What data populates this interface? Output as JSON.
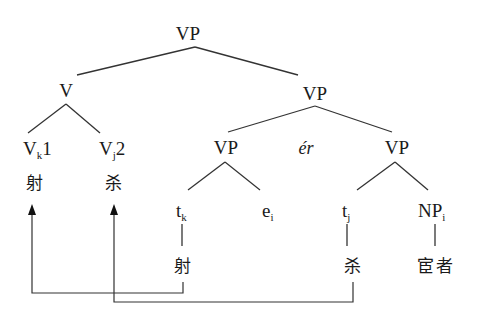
{
  "diagram": {
    "type": "syntax-tree",
    "nodes": {
      "root": {
        "label": "VP"
      },
      "v": {
        "label": "V"
      },
      "vk1": {
        "label": "V",
        "sub": "k",
        "suffix": "1",
        "gloss": "射"
      },
      "vj2": {
        "label": "V",
        "sub": "j",
        "suffix": "2",
        "gloss": "杀"
      },
      "vp_mid": {
        "label": "VP"
      },
      "vp_left": {
        "label": "VP"
      },
      "conj": {
        "label": "ér"
      },
      "vp_right": {
        "label": "VP"
      },
      "tk": {
        "label": "t",
        "sub": "k",
        "gloss": "射"
      },
      "ei": {
        "label": "e",
        "sub": "i"
      },
      "tj": {
        "label": "t",
        "sub": "j",
        "gloss": "杀"
      },
      "npi": {
        "label": "NP",
        "sub": "i",
        "gloss": "宦者"
      }
    },
    "movements": [
      {
        "from": "tk",
        "to": "vk1",
        "description": "射 raises from t_k to V_k1"
      },
      {
        "from": "tj",
        "to": "vj2",
        "description": "杀 raises from t_j to V_j2"
      }
    ]
  }
}
